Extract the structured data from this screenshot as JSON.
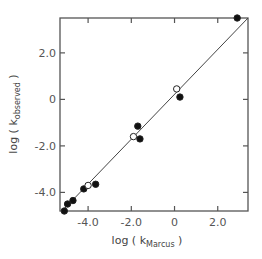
{
  "chart_data": {
    "type": "scatter",
    "title": "",
    "xlabel": "log ( k_Marcus )",
    "ylabel": "log ( k_observed )",
    "xlabel_parts": {
      "prefix": "log ( k",
      "subscript": "Marcus",
      "suffix": " )"
    },
    "ylabel_parts": {
      "prefix": "log ( k",
      "subscript": "observed",
      "suffix": " )"
    },
    "xlim": [
      -5.3,
      3.4
    ],
    "ylim": [
      -4.8,
      3.5
    ],
    "xticks": [
      -4.0,
      -2.0,
      0,
      2.0
    ],
    "yticks": [
      -4.0,
      -2.0,
      0,
      2.0
    ],
    "xtick_labels": [
      "-4.0",
      "-2.0",
      "0",
      "2.0"
    ],
    "ytick_labels": [
      "-4.0",
      "-2.0",
      "0",
      "2.0"
    ],
    "grid": false,
    "legend": null,
    "series": [
      {
        "name": "filled circles",
        "marker": "filled-circle",
        "points": [
          {
            "x": -5.1,
            "y": -4.8
          },
          {
            "x": -4.95,
            "y": -4.5
          },
          {
            "x": -4.7,
            "y": -4.35
          },
          {
            "x": -4.2,
            "y": -3.85
          },
          {
            "x": -3.65,
            "y": -3.65
          },
          {
            "x": -1.7,
            "y": -1.15
          },
          {
            "x": -1.6,
            "y": -1.7
          },
          {
            "x": 0.25,
            "y": 0.1
          },
          {
            "x": 2.9,
            "y": 3.5
          }
        ]
      },
      {
        "name": "open circles",
        "marker": "open-circle",
        "points": [
          {
            "x": -4.0,
            "y": -3.7
          },
          {
            "x": -1.9,
            "y": -1.6
          },
          {
            "x": 0.1,
            "y": 0.45
          }
        ]
      }
    ],
    "reference_line": {
      "name": "fit line",
      "from": {
        "x": -5.2,
        "y": -4.8
      },
      "to": {
        "x": 3.4,
        "y": 3.5
      }
    }
  }
}
